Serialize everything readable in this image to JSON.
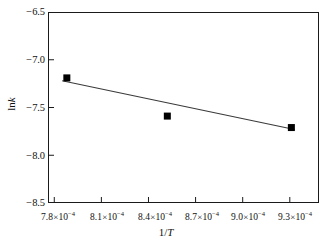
{
  "chart_data": {
    "type": "scatter",
    "title": "",
    "subtitle": "",
    "xlabel": "1/T",
    "ylabel": "lnk",
    "xlabel_parts": {
      "prefix": "1/",
      "italic": "T"
    },
    "ylabel_parts": {
      "prefix": "ln",
      "italic": "k"
    },
    "xlim": [
      0.000776,
      0.0009486
    ],
    "ylim": [
      -8.5,
      -6.5
    ],
    "grid": false,
    "legend": null,
    "x_tick_values": [
      0.00078,
      0.00081,
      0.00084,
      0.00087,
      0.0009,
      0.00093
    ],
    "x_tick_labels": [
      "7.8×10⁻⁴",
      "8.1×10⁻⁴",
      "8.4×10⁻⁴",
      "8.7×10⁻⁴",
      "9.0×10⁻⁴",
      "9.3×10⁻⁴"
    ],
    "x_tick_parts": [
      {
        "mantissa": "7.8",
        "times": "×",
        "base": "10",
        "exponent": "−4"
      },
      {
        "mantissa": "8.1",
        "times": "×",
        "base": "10",
        "exponent": "−4"
      },
      {
        "mantissa": "8.4",
        "times": "×",
        "base": "10",
        "exponent": "−4"
      },
      {
        "mantissa": "8.7",
        "times": "×",
        "base": "10",
        "exponent": "−4"
      },
      {
        "mantissa": "9.0",
        "times": "×",
        "base": "10",
        "exponent": "−4"
      },
      {
        "mantissa": "9.3",
        "times": "×",
        "base": "10",
        "exponent": "−4"
      }
    ],
    "y_tick_values": [
      -6.5,
      -7.0,
      -7.5,
      -8.0,
      -8.5
    ],
    "y_tick_labels": [
      "−6.5",
      "−7.0",
      "−7.5",
      "−8.0",
      "−8.5"
    ],
    "series": [
      {
        "name": "data points",
        "marker": "filled-square",
        "marker_color": "#000000",
        "points": [
          {
            "x": 0.000788,
            "y": -7.19
          },
          {
            "x": 0.000852,
            "y": -7.59
          },
          {
            "x": 0.000931,
            "y": -7.71
          }
        ]
      },
      {
        "name": "linear fit",
        "type": "line",
        "line_color": "#3a3a3a",
        "endpoints": [
          {
            "x": 0.000785,
            "y": -7.22
          },
          {
            "x": 0.000933,
            "y": -7.73
          }
        ]
      }
    ]
  },
  "figure": {
    "background_color": "#ffffff",
    "axis_color": "#1a1a1a",
    "text_color": "#111111"
  }
}
